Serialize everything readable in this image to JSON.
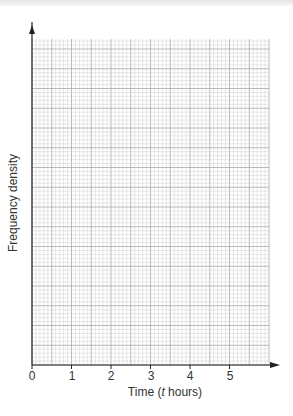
{
  "chart_data": {
    "type": "bar",
    "title": "",
    "xlabel": "Time (t hours)",
    "ylabel": "Frequency density",
    "x_ticks": [
      "0",
      "1",
      "2",
      "3",
      "4",
      "5"
    ],
    "xlim": [
      0,
      6
    ],
    "ylim": [],
    "grid": true,
    "categories": [],
    "values": [],
    "note": "Blank graph paper grid for drawing a histogram; no data plotted"
  },
  "labels": {
    "x_pre": "Time (",
    "x_var": "t",
    "x_post": " hours)",
    "y": "Frequency density"
  },
  "colors": {
    "minor_grid": "#cfcfcf",
    "major_grid": "#a8a8a8",
    "axis": "#222222"
  }
}
